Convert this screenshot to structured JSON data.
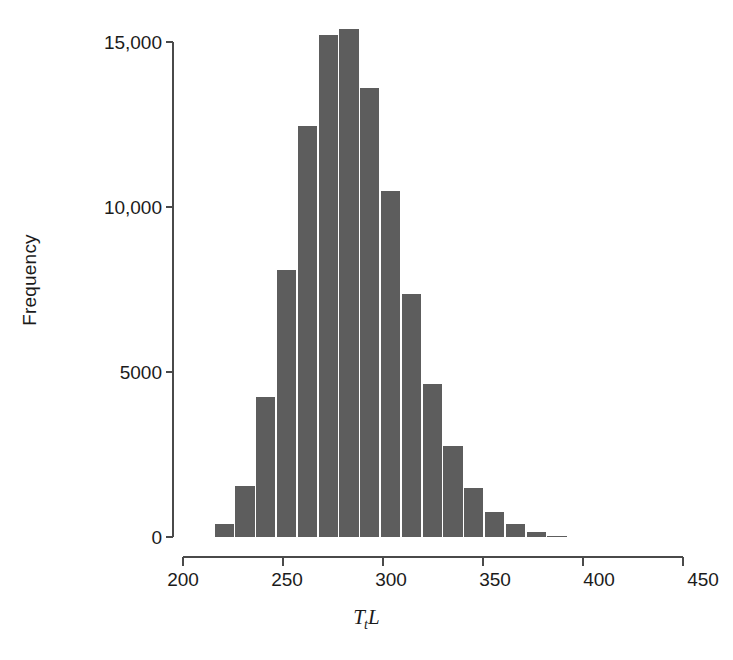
{
  "chart_data": {
    "type": "bar",
    "subtype": "histogram",
    "title": "",
    "xlabel": "TtL",
    "xlabel_parts": {
      "variable": "T",
      "subscript": "t",
      "variable2": "L"
    },
    "ylabel": "Frequency",
    "xlim": [
      200,
      450
    ],
    "ylim": [
      0,
      15500
    ],
    "xticks": [
      200,
      250,
      300,
      350,
      400,
      450
    ],
    "xtick_labels": [
      "200",
      "250",
      "300",
      "350",
      "400",
      "450"
    ],
    "yticks": [
      0,
      5000,
      10000,
      15000
    ],
    "ytick_labels": [
      "0",
      "5000",
      "10,000",
      "15,000"
    ],
    "grid": false,
    "legend": false,
    "bar_color": "#5d5d5d",
    "bin_width": 10,
    "bin_starts": [
      220,
      230,
      240,
      250,
      260,
      270,
      280,
      290,
      300,
      310,
      320,
      330,
      340,
      350,
      360,
      370,
      380
    ],
    "categories": [
      "220-230",
      "230-240",
      "240-250",
      "250-260",
      "260-270",
      "270-280",
      "280-290",
      "290-300",
      "300-310",
      "310-320",
      "320-330",
      "330-340",
      "340-350",
      "350-360",
      "360-370",
      "370-380",
      "380-390"
    ],
    "bin_centers": [
      225,
      235,
      245,
      255,
      265,
      275,
      285,
      295,
      305,
      315,
      325,
      335,
      345,
      355,
      365,
      375,
      385
    ],
    "values": [
      400,
      1550,
      4250,
      8100,
      12450,
      15200,
      15400,
      13600,
      10500,
      7350,
      4650,
      2750,
      1500,
      750,
      380,
      140,
      40
    ]
  },
  "axes": {
    "y_title": "Frequency",
    "x_title": "TtL"
  }
}
